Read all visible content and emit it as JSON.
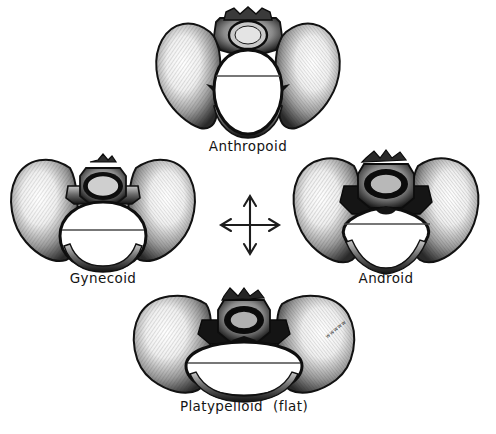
{
  "illustration": {
    "title": "Four types of female pelvis (Caldwell-Moloy classification)",
    "background_color": "#ffffff",
    "ink_color": "#141414"
  },
  "center_marker": {
    "name": "four-way-arrow-cross",
    "description": "Vertical and horizontal double-headed arrows crossing at center",
    "directions": [
      "up",
      "down",
      "left",
      "right"
    ]
  },
  "artist_signature": {
    "text": "wwwww",
    "legible": false
  },
  "pelvis_types": [
    {
      "id": "anthropoid",
      "label": "Anthropoid",
      "note": "",
      "position": "top",
      "inlet_shape": "long narrow oval, anteroposterior diameter greatest",
      "measurement_line": "transverse diameter"
    },
    {
      "id": "gynecoid",
      "label": "Gynecoid",
      "note": "",
      "position": "left",
      "inlet_shape": "rounded, slightly transverse oval",
      "measurement_line": "transverse diameter"
    },
    {
      "id": "android",
      "label": "Android",
      "note": "",
      "position": "right",
      "inlet_shape": "heart shaped / triangular with narrow forepelvis",
      "measurement_line": "transverse diameter"
    },
    {
      "id": "platypelloid",
      "label": "Platypelloid",
      "note": "(flat)",
      "position": "bottom",
      "inlet_shape": "wide flattened transverse oval",
      "measurement_line": "transverse diameter"
    }
  ]
}
